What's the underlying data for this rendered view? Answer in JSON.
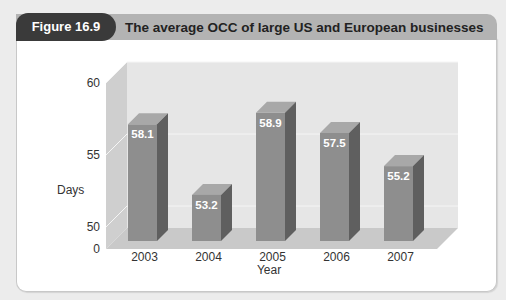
{
  "figure": {
    "label": "Figure 16.9",
    "title": "The average OCC of large US and European businesses"
  },
  "colors": {
    "pill": "#3a3a3a",
    "header_bar": "#b3b3b3",
    "bar_front": "#8e8e8e",
    "bar_side": "#5f5f5f",
    "bar_top": "#a8a8a8",
    "back_wall": "#e6e6e6",
    "side_wall": "#cfcfcf",
    "floor": "#c9c9c9"
  },
  "chart_data": {
    "type": "bar",
    "title": "The average OCC of large US and European businesses",
    "xlabel": "Year",
    "ylabel": "Days",
    "categories": [
      "2003",
      "2004",
      "2005",
      "2006",
      "2007"
    ],
    "values": [
      58.1,
      53.2,
      58.9,
      57.5,
      55.2
    ],
    "data_labels": [
      "58.1",
      "53.2",
      "58.9",
      "57.5",
      "55.2"
    ],
    "yticks": [
      "0",
      "50",
      "55",
      "60"
    ],
    "ylim": [
      0,
      60
    ],
    "axis_break": "between 0 and 50",
    "grid": true,
    "style": "3D columns",
    "legend": null
  }
}
